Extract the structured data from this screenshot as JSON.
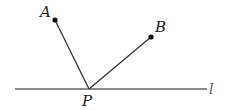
{
  "diagram": {
    "width": 227,
    "height": 110,
    "colors": {
      "background": "#ffffff",
      "stroke": "#333333",
      "line_l": "#666666",
      "point": "#111111"
    },
    "line_l": {
      "label": "l",
      "x1": 15,
      "y1": 89,
      "x2": 207,
      "y2": 89
    },
    "points": {
      "A": {
        "label": "A",
        "x": 55,
        "y": 20
      },
      "B": {
        "label": "B",
        "x": 151,
        "y": 37
      },
      "P": {
        "label": "P",
        "x": 89,
        "y": 89
      }
    },
    "segments": [
      {
        "name": "PA",
        "from": "P",
        "to": "A"
      },
      {
        "name": "PB",
        "from": "P",
        "to": "B"
      }
    ]
  }
}
